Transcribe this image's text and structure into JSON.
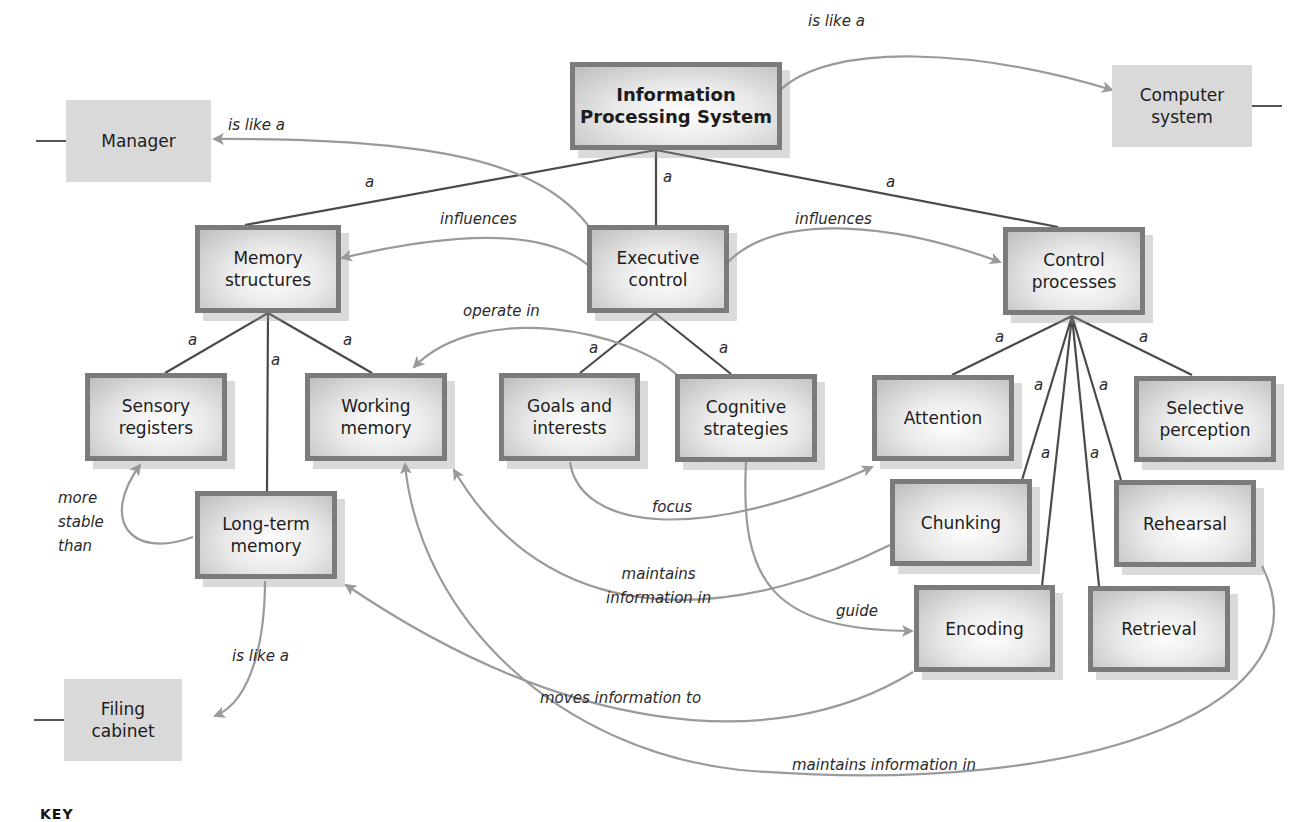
{
  "nodes": {
    "ips": {
      "line1": "Information",
      "line2": "Processing System"
    },
    "computer": {
      "line1": "Computer",
      "line2": "system"
    },
    "manager": {
      "line1": "Manager"
    },
    "memory_structures": {
      "line1": "Memory",
      "line2": "structures"
    },
    "executive_control": {
      "line1": "Executive",
      "line2": "control"
    },
    "control_processes": {
      "line1": "Control",
      "line2": "processes"
    },
    "sensory_registers": {
      "line1": "Sensory",
      "line2": "registers"
    },
    "working_memory": {
      "line1": "Working",
      "line2": "memory"
    },
    "goals_interests": {
      "line1": "Goals and",
      "line2": "interests"
    },
    "cognitive_strategies": {
      "line1": "Cognitive",
      "line2": "strategies"
    },
    "attention": {
      "line1": "Attention"
    },
    "selective_perception": {
      "line1": "Selective",
      "line2": "perception"
    },
    "long_term_memory": {
      "line1": "Long-term",
      "line2": "memory"
    },
    "chunking": {
      "line1": "Chunking"
    },
    "rehearsal": {
      "line1": "Rehearsal"
    },
    "encoding": {
      "line1": "Encoding"
    },
    "retrieval": {
      "line1": "Retrieval"
    },
    "filing_cabinet": {
      "line1": "Filing",
      "line2": "cabinet"
    }
  },
  "links": {
    "is_like_a": "is like a",
    "a": "a",
    "influences": "influences",
    "operate_in": "operate in",
    "more_stable_than": [
      "more",
      "stable",
      "than"
    ],
    "focus": "focus",
    "maintains_info_in_2line": [
      "maintains",
      "information in"
    ],
    "guide": "guide",
    "moves_information_to": "moves information to",
    "maintains_information_in": "maintains information in"
  },
  "key": {
    "label": "KEY"
  },
  "colors": {
    "line_dark": "#4a4a4a",
    "line_gray": "#9a9a9a",
    "border": "#7b7b7b",
    "analogy_fill": "#d9d9d9"
  }
}
